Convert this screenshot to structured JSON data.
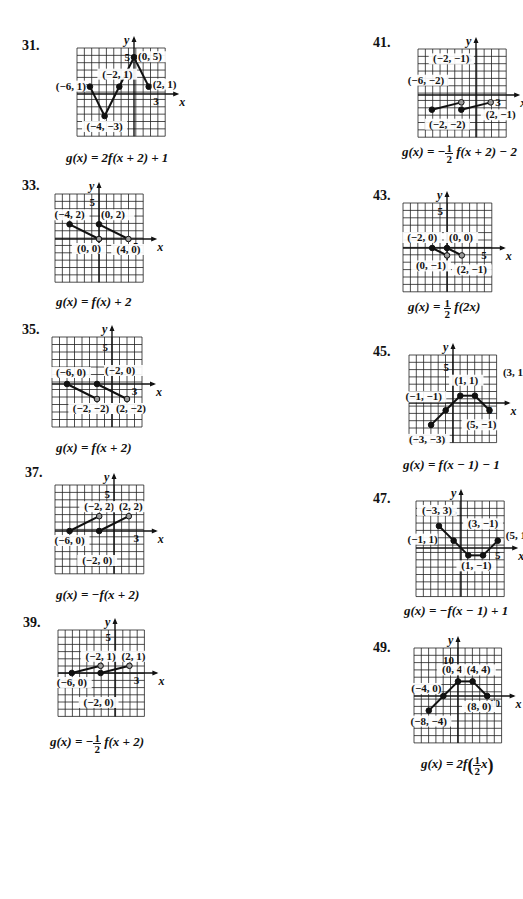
{
  "problems": [
    {
      "id": "31",
      "label": "31.",
      "equation": "g(x) = 2f(x + 2) + 1",
      "eq_parts": {
        "pre": "g(x) = 2f(x + 2) + 1"
      },
      "grid": {
        "x0": 77,
        "y0": 48,
        "cols": 12,
        "rows": 12,
        "cell": 7.35,
        "ox": 134,
        "oy": 94
      },
      "axis_ticks": [
        {
          "text": "5",
          "axis": "y",
          "value": 5
        },
        {
          "text": "3",
          "axis": "x",
          "value": 3
        }
      ],
      "segments": [
        [
          [
            -6,
            1
          ],
          [
            -4,
            -3
          ]
        ],
        [
          [
            -4,
            -3
          ],
          [
            0,
            5
          ]
        ],
        [
          [
            0,
            5
          ],
          [
            2,
            1
          ]
        ]
      ],
      "points": [
        {
          "x": -6,
          "y": 1,
          "open": false,
          "label": "(−6, 1)"
        },
        {
          "x": -4,
          "y": -3,
          "open": false,
          "label": "(−4, −3)"
        },
        {
          "x": -2,
          "y": 1,
          "open": false,
          "label": "(−2, 1)"
        },
        {
          "x": 0,
          "y": 5,
          "open": false,
          "label": "(0, 5)"
        },
        {
          "x": 2,
          "y": 1,
          "open": false,
          "label": "(2, 1)"
        }
      ]
    },
    {
      "id": "33",
      "label": "33.",
      "equation": "g(x) = f(x) + 2",
      "grid": {
        "x0": 55,
        "y0": 194,
        "cols": 12,
        "rows": 12,
        "cell": 7.35,
        "ox": 99,
        "oy": 239
      },
      "axis_ticks": [
        {
          "text": "5",
          "axis": "y",
          "value": 5
        },
        {
          "text": "5",
          "axis": "x",
          "value": 5
        }
      ],
      "segments": [
        [
          [
            -4,
            2
          ],
          [
            0,
            0
          ]
        ],
        [
          [
            0,
            2
          ],
          [
            4,
            0
          ]
        ]
      ],
      "points": [
        {
          "x": -4,
          "y": 2,
          "open": false,
          "label": "(−4, 2)"
        },
        {
          "x": 0,
          "y": 0,
          "open": true,
          "label": "(0, 0)"
        },
        {
          "x": 0,
          "y": 2,
          "open": false,
          "label": "(0, 2)"
        },
        {
          "x": 4,
          "y": 0,
          "open": true,
          "label": "(4, 0)"
        }
      ]
    },
    {
      "id": "35",
      "label": "35.",
      "equation": "g(x) = f(x + 2)",
      "grid": {
        "x0": 52,
        "y0": 337,
        "cols": 12,
        "rows": 12,
        "cell": 7.5,
        "ox": 112,
        "oy": 384
      },
      "axis_ticks": [
        {
          "text": "5",
          "axis": "y",
          "value": 5
        },
        {
          "text": "3",
          "axis": "x",
          "value": 3
        }
      ],
      "segments": [
        [
          [
            -6,
            0
          ],
          [
            -2,
            -2
          ]
        ],
        [
          [
            -2,
            0
          ],
          [
            2,
            -2
          ]
        ]
      ],
      "points": [
        {
          "x": -6,
          "y": 0,
          "open": false,
          "label": "(−6, 0)"
        },
        {
          "x": -2,
          "y": -2,
          "open": true,
          "label": "(−2, −2)"
        },
        {
          "x": -2,
          "y": 0,
          "open": false,
          "label": "(−2, 0)"
        },
        {
          "x": 2,
          "y": -2,
          "open": true,
          "label": "(2, −2)"
        }
      ]
    },
    {
      "id": "37",
      "label": "37.",
      "equation": "g(x) = −f(x + 2)",
      "grid": {
        "x0": 55,
        "y0": 485,
        "cols": 12,
        "rows": 12,
        "cell": 7.4,
        "ox": 114,
        "oy": 531
      },
      "axis_ticks": [
        {
          "text": "5",
          "axis": "y",
          "value": 5
        },
        {
          "text": "3",
          "axis": "x",
          "value": 3
        }
      ],
      "segments": [
        [
          [
            -6,
            0
          ],
          [
            -2,
            2
          ]
        ],
        [
          [
            -2,
            0
          ],
          [
            2,
            2
          ]
        ]
      ],
      "points": [
        {
          "x": -6,
          "y": 0,
          "open": false,
          "label": "(−6, 0)"
        },
        {
          "x": -2,
          "y": 2,
          "open": true,
          "label": "(−2, 2)"
        },
        {
          "x": -2,
          "y": 0,
          "open": false,
          "label": "(−2, 0)"
        },
        {
          "x": 2,
          "y": 2,
          "open": true,
          "label": "(2, 2)"
        }
      ]
    },
    {
      "id": "39",
      "label": "39.",
      "equation": "g(x) = −½ f(x + 2)",
      "eq_parts": {
        "pre": "g(x) = −",
        "num": "1",
        "den": "2",
        "post": "f(x + 2)"
      },
      "grid": {
        "x0": 58,
        "y0": 630,
        "cols": 12,
        "rows": 12,
        "cell": 7.2,
        "ox": 115,
        "oy": 673
      },
      "axis_ticks": [
        {
          "text": "5",
          "axis": "y",
          "value": 5
        },
        {
          "text": "3",
          "axis": "x",
          "value": 3
        }
      ],
      "segments": [
        [
          [
            -6,
            0
          ],
          [
            -2,
            1
          ]
        ],
        [
          [
            -2,
            0
          ],
          [
            2,
            1
          ]
        ]
      ],
      "points": [
        {
          "x": -6,
          "y": 0,
          "open": false,
          "label": "(−6, 0)"
        },
        {
          "x": -2,
          "y": 1,
          "open": true,
          "label": "(−2, 1)"
        },
        {
          "x": -2,
          "y": 0,
          "open": false,
          "label": "(−2, 0)"
        },
        {
          "x": 2,
          "y": 1,
          "open": true,
          "label": "(2, 1)"
        }
      ]
    },
    {
      "id": "41",
      "label": "41.",
      "equation": "g(x) = −½ f(x + 2) − 2",
      "eq_parts": {
        "pre": "g(x) = −",
        "num": "1",
        "den": "2",
        "post": "f(x + 2) − 2"
      },
      "grid": {
        "x0": 418,
        "y0": 49,
        "cols": 12,
        "rows": 12,
        "cell": 7.35,
        "ox": 476,
        "oy": 95
      },
      "axis_ticks": [
        {
          "text": "5",
          "axis": "y",
          "value": 5
        },
        {
          "text": "3",
          "axis": "x",
          "value": 3
        }
      ],
      "segments": [
        [
          [
            -6,
            -2
          ],
          [
            -2,
            -1
          ]
        ],
        [
          [
            -2,
            -2
          ],
          [
            2,
            -1
          ]
        ]
      ],
      "points": [
        {
          "x": -6,
          "y": -2,
          "open": false,
          "label": "(−6, −2)"
        },
        {
          "x": -2,
          "y": -1,
          "open": true,
          "label": "(−2, −1)"
        },
        {
          "x": -2,
          "y": -2,
          "open": false,
          "label": "(−2, −2)"
        },
        {
          "x": 2,
          "y": -1,
          "open": true,
          "label": "(2, −1)"
        }
      ]
    },
    {
      "id": "43",
      "label": "43.",
      "equation": "g(x) = ½ f(2x)",
      "eq_parts": {
        "pre": "g(x) = ",
        "num": "1",
        "den": "2",
        "post": "f(2x)"
      },
      "grid": {
        "x0": 403,
        "y0": 203,
        "cols": 12,
        "rows": 12,
        "cell": 7.4,
        "ox": 447,
        "oy": 248
      },
      "axis_ticks": [
        {
          "text": "5",
          "axis": "y",
          "value": 5
        },
        {
          "text": "5",
          "axis": "x",
          "value": 5
        }
      ],
      "segments": [
        [
          [
            -2,
            0
          ],
          [
            0,
            -1
          ]
        ],
        [
          [
            0,
            0
          ],
          [
            2,
            -1
          ]
        ]
      ],
      "points": [
        {
          "x": -2,
          "y": 0,
          "open": false,
          "label": "(−2, 0)"
        },
        {
          "x": 0,
          "y": -1,
          "open": true,
          "label": "(0, −1)"
        },
        {
          "x": 0,
          "y": 0,
          "open": false,
          "label": "(0, 0)"
        },
        {
          "x": 2,
          "y": -1,
          "open": true,
          "label": "(2, −1)"
        }
      ]
    },
    {
      "id": "45",
      "label": "45.",
      "equation": "g(x) = f(x − 1) − 1",
      "grid": {
        "x0": 409,
        "y0": 355,
        "cols": 12,
        "rows": 12,
        "cell": 7.3,
        "ox": 453,
        "oy": 403
      },
      "axis_ticks": [
        {
          "text": "5",
          "axis": "y",
          "value": 5
        },
        {
          "text": "5",
          "axis": "x",
          "value": 5
        }
      ],
      "segments": [
        [
          [
            -3,
            -3
          ],
          [
            -1,
            -1
          ]
        ],
        [
          [
            -1,
            -1
          ],
          [
            1,
            1
          ]
        ],
        [
          [
            1,
            1
          ],
          [
            3,
            1
          ]
        ],
        [
          [
            3,
            1
          ],
          [
            5,
            -1
          ]
        ]
      ],
      "points": [
        {
          "x": -3,
          "y": -3,
          "open": false,
          "label": "(−3, −3)"
        },
        {
          "x": -1,
          "y": -1,
          "open": false,
          "label": "(−1, −1)"
        },
        {
          "x": 1,
          "y": 1,
          "open": false,
          "label": "(1, 1)"
        },
        {
          "x": 3,
          "y": 1,
          "open": false,
          "label": "(3, 1"
        },
        {
          "x": 5,
          "y": -1,
          "open": false,
          "label": "(5, −1)"
        }
      ]
    },
    {
      "id": "47",
      "label": "47.",
      "equation": "g(x) = −f(x − 1) + 1",
      "grid": {
        "x0": 416,
        "y0": 501,
        "cols": 12,
        "rows": 13,
        "cell": 7.35,
        "ox": 461,
        "oy": 548
      },
      "axis_ticks": [
        {
          "text": "5",
          "axis": "y",
          "value": 5
        },
        {
          "text": "5",
          "axis": "x",
          "value": 5
        }
      ],
      "segments": [
        [
          [
            -3,
            3
          ],
          [
            -1,
            1
          ]
        ],
        [
          [
            -1,
            1
          ],
          [
            1,
            -1
          ]
        ],
        [
          [
            1,
            -1
          ],
          [
            3,
            -1
          ]
        ],
        [
          [
            3,
            -1
          ],
          [
            5,
            1
          ]
        ]
      ],
      "points": [
        {
          "x": -3,
          "y": 3,
          "open": false,
          "label": "(−3, 3)"
        },
        {
          "x": -1,
          "y": 1,
          "open": false,
          "label": "(−1, 1)"
        },
        {
          "x": 1,
          "y": -1,
          "open": false,
          "label": "(1, −1)"
        },
        {
          "x": 3,
          "y": -1,
          "open": false,
          "label": "(3, −1)"
        },
        {
          "x": 5,
          "y": 1,
          "open": false,
          "label": "(5, 1"
        }
      ]
    },
    {
      "id": "49",
      "label": "49.",
      "equation": "g(x) = 2f(½x)",
      "eq_parts": {
        "pre": "g(x) = 2f",
        "num": "1",
        "den": "2",
        "post": "x"
      },
      "grid": {
        "x0": 414,
        "y0": 648,
        "cols": 12,
        "rows": 13,
        "cell": 7.3,
        "ox": 458,
        "oy": 696,
        "unit": 0.5
      },
      "axis_ticks": [
        {
          "text": "10",
          "axis": "y",
          "value": 10
        },
        {
          "text": "10",
          "axis": "x",
          "value": 10
        }
      ],
      "segments": [
        [
          [
            -8,
            -4
          ],
          [
            -4,
            0
          ]
        ],
        [
          [
            -4,
            0
          ],
          [
            0,
            4
          ]
        ],
        [
          [
            0,
            4
          ],
          [
            4,
            4
          ]
        ],
        [
          [
            4,
            4
          ],
          [
            8,
            0
          ]
        ]
      ],
      "points": [
        {
          "x": -8,
          "y": -4,
          "open": false,
          "label": "(−8, −4)"
        },
        {
          "x": -4,
          "y": 0,
          "open": false,
          "label": "(−4, 0)"
        },
        {
          "x": 0,
          "y": 4,
          "open": false,
          "label": "(0, 4)"
        },
        {
          "x": 4,
          "y": 4,
          "open": false,
          "label": "(4, 4)"
        },
        {
          "x": 8,
          "y": 0,
          "open": false,
          "label": "(8, 0)"
        }
      ]
    }
  ],
  "axis_labels": {
    "x": "x",
    "y": "y"
  },
  "colors": {
    "ink": "#111111",
    "grid": "#222222",
    "open_fill": "#999999",
    "background": "#ffffff"
  }
}
